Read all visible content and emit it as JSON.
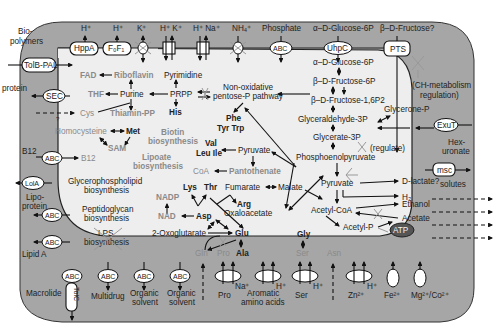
{
  "colors": {
    "outer_membrane": "#a6a6a6",
    "cytoplasm": "#eeeeee",
    "background": "#ffffff",
    "ink": "#222222",
    "gray_text": "#8a8a8a",
    "atp_fill": "#555555"
  },
  "top_inputs": {
    "biopolymers": "Bio-",
    "biopolymers2": "polymers",
    "h1": "H⁺",
    "h2": "H⁺",
    "k": "K⁺",
    "hk": "H⁺ K⁺",
    "hna": "H⁺ Na⁺",
    "nh4": "NH₄⁺",
    "phosphate": "Phosphate",
    "glc6p_out": "α–D-Glucose-6P",
    "fructose_out": "β–D-Fructose?"
  },
  "transporters": {
    "tolb_pal": "TolB-PAL",
    "hppa": "HppA",
    "fof1": "F₀F₁",
    "abc": "ABC",
    "uhpc": "UhpC",
    "pts": "PTS",
    "sec": "SEC",
    "lola": "LolA",
    "exut": "ExuT",
    "msc": "msc",
    "tolc": "TolC",
    "atp": "ATP"
  },
  "left_labels": {
    "protein": "protein",
    "b12": "B12",
    "lipoprotein1": "Lipo-",
    "lipoprotein2": "protein",
    "protein2": "protein",
    "lipid_a": "Lipid A",
    "macrolide": "Macrolide",
    "question": "?"
  },
  "right_labels": {
    "ch_reg1": "(CH-metabolism",
    "ch_reg2": "regulation)",
    "hexuronate1": "Hex-",
    "hexuronate2": "uronate",
    "solutes": "solutes"
  },
  "bottom_labels": {
    "multidrug": "Multidrug",
    "organic_solvent_1a": "Organic",
    "organic_solvent_1b": "solvent",
    "organic_solvent_2a": "Organic",
    "organic_solvent_2b": "solvent",
    "pro": "Pro",
    "na": "Na⁺",
    "aromatic1": "Aromatic",
    "aromatic2": "amino acids",
    "h_arom": "H⁺",
    "ser": "Ser",
    "h_ser": "H⁺",
    "zn": "Zn²⁺",
    "h_zn": "H⁺",
    "fe": "Fe²⁺",
    "mgco": "Mg²⁺/Co²⁺"
  },
  "metabolites": {
    "fad": "FAD",
    "riboflavin": "Riboflavin",
    "pyrimidine": "Pyrimidine",
    "thf": "THF",
    "purine": "Purine",
    "prpp": "PRPP",
    "cys": "Cys",
    "thiamin_pp": "Thiamin-PP",
    "his": "His",
    "homocysteine": "Homocysteine",
    "met": "Met",
    "sam": "SAM",
    "b12_in": "B12",
    "biotin1": "Biotin",
    "biotin2": "biosynthesis",
    "lipoate1": "Lipoate",
    "lipoate2": "biosynthesis",
    "gpl1": "Glycerophospholipid",
    "gpl2": "biosynthesis",
    "pg1": "Peptidoglycan",
    "pg2": "biosynthesis",
    "lps1": "LPS",
    "lps2": "biosynthesis",
    "ppp1": "Non-oxidative",
    "ppp2": "pentose-P pathway",
    "phe": "Phe",
    "tyrtrp": "Tyr Trp",
    "val": "Val",
    "leuile": "Leu Ile",
    "pyruvate_up": "Pyruvate",
    "coa": "CoA",
    "pantothenate": "Pantothenate",
    "glc6p": "α–D-Glucose-6P",
    "fru6p": "β–D-Fructose-6P",
    "fru16bp": "β–D-Fructose-1,6P2",
    "glycerone": "Glycerone-P",
    "g3p": "Glyceraldehyde-3P",
    "glycerate": "Glycerate-3P",
    "regulate": "(regulate)",
    "pep": "Phosphoenolpyruvate",
    "nadp": "NADP",
    "nad": "NAD",
    "lys": "Lys",
    "thr": "Thr",
    "fumarate": "Fumarate",
    "malate": "Malate",
    "arg": "Arg",
    "asp": "Asp",
    "oxaloacetate": "Oxaloacetate",
    "oxoglutarate": "2-Oxoglutarate",
    "glu": "Glu",
    "gln": "Gln",
    "pro_in": "Pro",
    "ala": "Ala",
    "gly": "Gly",
    "ser_in": "Ser",
    "asn": "Asn",
    "pyruvate": "Pyruvate",
    "dlactate": "D-lactate?",
    "h2": "H₂",
    "acetylcoa": "Acetyl-CoA",
    "ethanol": "Ethanol",
    "acetate": "Acetate",
    "acetylp": "Acetyl-P"
  }
}
